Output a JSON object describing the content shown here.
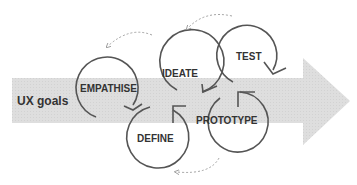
{
  "diagram": {
    "band_label": "UX goals",
    "stages": [
      {
        "id": "empathise",
        "label": "EMPATHISE"
      },
      {
        "id": "define",
        "label": "DEFINE"
      },
      {
        "id": "ideate",
        "label": "IDEATE"
      },
      {
        "id": "prototype",
        "label": "PROTOTYPE"
      },
      {
        "id": "test",
        "label": "TEST"
      }
    ],
    "colors": {
      "band": "#dcdcdc",
      "circle_stroke": "#555555",
      "text": "#333333",
      "dashed": "#999999"
    }
  }
}
